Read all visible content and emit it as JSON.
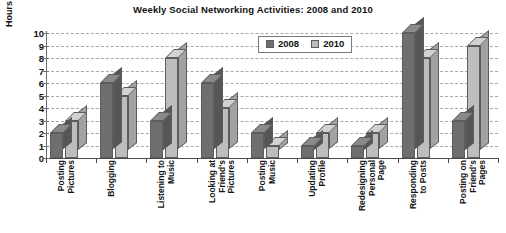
{
  "chart_data": {
    "type": "bar",
    "title": "Weekly Social Networking Activities: 2008 and 2010",
    "xlabel": "",
    "ylabel": "Hours Per Week",
    "ylim": [
      0,
      10
    ],
    "ytick_labels": [
      "10",
      "9",
      "8",
      "7",
      "6",
      "5",
      "4",
      "3",
      "2",
      "1",
      "0"
    ],
    "grid": true,
    "legend_position": "top-right-inside",
    "categories": [
      "Posting\nPictures",
      "Blogging",
      "Listening to\nMusic",
      "Looking at\nFriend's\nPictures",
      "Posting\nMusic",
      "Updating\nProfile",
      "Redesigning\nPersonal\nPage",
      "Responding\nto Posts",
      "Posting on\nFriend's\nPages"
    ],
    "series": [
      {
        "name": "2008",
        "color": "#6f6f6f",
        "values": [
          2,
          6,
          3,
          6,
          2,
          1,
          1,
          10,
          3
        ]
      },
      {
        "name": "2010",
        "color": "#bdbdbd",
        "values": [
          3,
          5,
          8,
          4,
          1,
          2,
          2,
          8,
          9
        ]
      }
    ]
  },
  "legend": {
    "items": [
      {
        "label": "2008",
        "swatch": "legend-swatch-2008"
      },
      {
        "label": "2010",
        "swatch": "legend-swatch-2010"
      }
    ]
  },
  "colors": {
    "series_2008": "#6f6f6f",
    "series_2010": "#bdbdbd",
    "gridline": "#a8a8a8",
    "axis": "#4a4a4a",
    "background": "#ffffff"
  }
}
